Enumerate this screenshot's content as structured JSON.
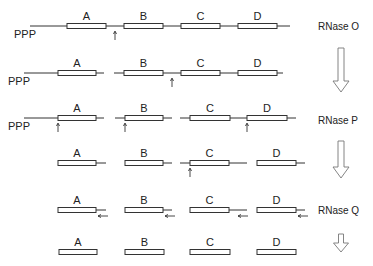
{
  "figure": {
    "title": "",
    "enzymes": [
      {
        "label": "RNase O",
        "x": 318,
        "y": 30
      },
      {
        "label": "RNase P",
        "x": 318,
        "y": 124
      },
      {
        "label": "RNase Q",
        "x": 318,
        "y": 214
      }
    ],
    "ppp_label": "PPP",
    "gene_labels": [
      "A",
      "B",
      "C",
      "D"
    ],
    "rows": [
      {
        "y": 26,
        "ppp": {
          "x": 14,
          "y": 38
        },
        "lines": [
          [
            30,
            290
          ]
        ],
        "boxes": [
          {
            "label": "A",
            "x1": 67,
            "x2": 106
          },
          {
            "label": "B",
            "x1": 124,
            "x2": 163
          },
          {
            "label": "C",
            "x1": 181,
            "x2": 220
          },
          {
            "label": "D",
            "x1": 238,
            "x2": 277
          }
        ],
        "cut_arrows": [
          {
            "x": 115,
            "dir": "up"
          }
        ]
      },
      {
        "y": 73,
        "ppp": {
          "x": 8,
          "y": 85
        },
        "lines": [
          [
            24,
            104
          ],
          [
            114,
            283
          ]
        ],
        "boxes": [
          {
            "label": "A",
            "x1": 58,
            "x2": 96
          },
          {
            "label": "B",
            "x1": 124,
            "x2": 163
          },
          {
            "label": "C",
            "x1": 181,
            "x2": 220
          },
          {
            "label": "D",
            "x1": 238,
            "x2": 277
          }
        ],
        "cut_arrows": [
          {
            "x": 172,
            "dir": "up"
          }
        ]
      },
      {
        "y": 118,
        "ppp": {
          "x": 8,
          "y": 130
        },
        "lines": [
          [
            24,
            104
          ],
          [
            115,
            172
          ],
          [
            180,
            296
          ]
        ],
        "boxes": [
          {
            "label": "A",
            "x1": 58,
            "x2": 96
          },
          {
            "label": "B",
            "x1": 125,
            "x2": 163
          },
          {
            "label": "C",
            "x1": 190,
            "x2": 230
          },
          {
            "label": "D",
            "x1": 247,
            "x2": 287
          }
        ],
        "cut_arrows": [
          {
            "x": 58,
            "dir": "up"
          },
          {
            "x": 125,
            "dir": "up"
          },
          {
            "x": 247,
            "dir": "up"
          }
        ]
      },
      {
        "y": 163,
        "lines": [
          [
            58,
            106
          ],
          [
            125,
            172
          ],
          [
            180,
            247
          ],
          [
            257,
            305
          ]
        ],
        "boxes": [
          {
            "label": "A",
            "x1": 58,
            "x2": 96
          },
          {
            "label": "B",
            "x1": 125,
            "x2": 163
          },
          {
            "label": "C",
            "x1": 190,
            "x2": 229
          },
          {
            "label": "D",
            "x1": 257,
            "x2": 296
          }
        ],
        "cut_arrows": [
          {
            "x": 190,
            "dir": "up"
          }
        ]
      },
      {
        "y": 210,
        "lines": [
          [
            58,
            106
          ],
          [
            125,
            172
          ],
          [
            190,
            247
          ],
          [
            257,
            305
          ]
        ],
        "boxes": [
          {
            "label": "A",
            "x1": 58,
            "x2": 96
          },
          {
            "label": "B",
            "x1": 125,
            "x2": 163
          },
          {
            "label": "C",
            "x1": 190,
            "x2": 229
          },
          {
            "label": "D",
            "x1": 257,
            "x2": 296
          }
        ],
        "cut_arrows": [
          {
            "x": 98,
            "y": 216,
            "dir": "left"
          },
          {
            "x": 165,
            "y": 216,
            "dir": "left"
          },
          {
            "x": 238,
            "y": 216,
            "dir": "left"
          },
          {
            "x": 298,
            "y": 216,
            "dir": "left"
          }
        ]
      },
      {
        "y": 252,
        "lines": [],
        "boxes": [
          {
            "label": "A",
            "x1": 59,
            "x2": 97
          },
          {
            "label": "B",
            "x1": 125,
            "x2": 164
          },
          {
            "label": "C",
            "x1": 190,
            "x2": 230
          },
          {
            "label": "D",
            "x1": 257,
            "x2": 296
          }
        ],
        "cut_arrows": []
      }
    ],
    "process_arrows": [
      {
        "x": 341,
        "y1": 48,
        "y2": 92,
        "w": 6,
        "head": 11
      },
      {
        "x": 341,
        "y1": 141,
        "y2": 178,
        "w": 6,
        "head": 11
      },
      {
        "x": 341,
        "y1": 234,
        "y2": 252,
        "w": 5,
        "head": 9
      }
    ]
  }
}
